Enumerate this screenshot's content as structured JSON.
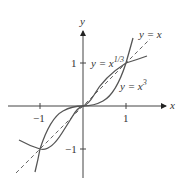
{
  "figure": {
    "axes": {
      "x_label": "x",
      "y_label": "y",
      "x_ticks": [
        {
          "value": -1,
          "label": "−1"
        },
        {
          "value": 1,
          "label": "1"
        }
      ],
      "y_ticks": [
        {
          "value": 1,
          "label": "1"
        },
        {
          "value": -1,
          "label": "−1"
        }
      ]
    },
    "curves": [
      {
        "name": "identity",
        "label": "y = x",
        "style": "dashed"
      },
      {
        "name": "cube-root",
        "label": "y = x^(1/3)",
        "label_base": "y = x",
        "label_exp": "1/3",
        "style": "solid"
      },
      {
        "name": "cube",
        "label": "y = x^3",
        "label_base": "y = x",
        "label_exp": "3",
        "style": "solid"
      }
    ],
    "colors": {
      "curve": "#555555",
      "axis": "#444444",
      "text": "#333333"
    }
  }
}
